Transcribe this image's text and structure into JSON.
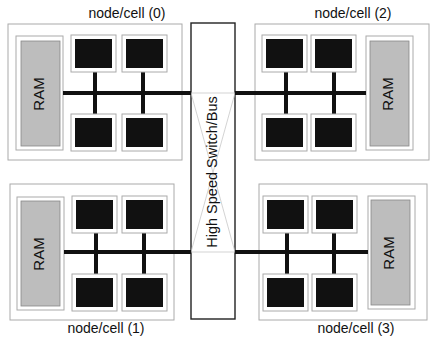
{
  "switch": {
    "label": "High Speed Switch/Bus"
  },
  "nodes": [
    {
      "id": 0,
      "label": "node/cell (0)",
      "ram": "RAM",
      "cpus": [
        "CPU",
        "CPU",
        "CPU",
        "CPU"
      ]
    },
    {
      "id": 1,
      "label": "node/cell (1)",
      "ram": "RAM",
      "cpus": [
        "CPU",
        "CPU",
        "CPU",
        "CPU"
      ]
    },
    {
      "id": 2,
      "label": "node/cell (2)",
      "ram": "RAM",
      "cpus": [
        "CPU",
        "CPU",
        "CPU",
        "CPU"
      ]
    },
    {
      "id": 3,
      "label": "node/cell (3)",
      "ram": "RAM",
      "cpus": [
        "CPU",
        "CPU",
        "CPU",
        "CPU"
      ]
    }
  ],
  "colors": {
    "cpu_fill": "#111111",
    "ram_fill": "#bdbdbd",
    "box_border": "#a8a8a8",
    "bus": "#111111"
  }
}
